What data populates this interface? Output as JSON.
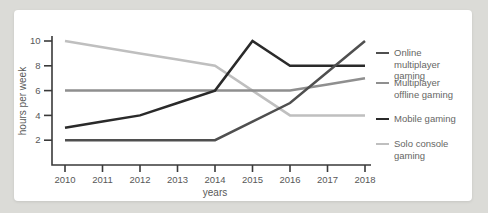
{
  "colors": {
    "page_background": "#dbdbd7",
    "card_background": "#ffffff",
    "axis": "#3a3a3a",
    "tick_text": "#585858",
    "legend_text": "#666664"
  },
  "chart_data": {
    "type": "line",
    "title": "",
    "xlabel": "years",
    "ylabel": "hours per week",
    "x": [
      2010,
      2011,
      2012,
      2013,
      2014,
      2015,
      2016,
      2017,
      2018
    ],
    "yticks": [
      2,
      4,
      6,
      8,
      10
    ],
    "ylim": [
      0,
      10.5
    ],
    "grid": false,
    "legend_position": "right",
    "series": [
      {
        "name": "Online multiplayer gaming",
        "label_lines": [
          "Online multiplayer",
          "gaming"
        ],
        "color": "#4f4f4f",
        "values": [
          2,
          2,
          2,
          2,
          2,
          3.5,
          5,
          7.5,
          10
        ]
      },
      {
        "name": "Multiplayer offline gaming",
        "label_lines": [
          "Multiplayer",
          "offline gaming"
        ],
        "color": "#8f8f8f",
        "values": [
          6,
          6,
          6,
          6,
          6,
          6,
          6,
          6.5,
          7
        ]
      },
      {
        "name": "Mobile gaming",
        "label_lines": [
          "Mobile gaming"
        ],
        "color": "#2a2a2a",
        "values": [
          3,
          3.5,
          4,
          5,
          6,
          10,
          8,
          8,
          8
        ]
      },
      {
        "name": "Solo console gaming",
        "label_lines": [
          "Solo console",
          "gaming"
        ],
        "color": "#bfbfbf",
        "values": [
          10,
          9.5,
          9,
          8.5,
          8,
          6,
          4,
          4,
          4
        ]
      }
    ]
  }
}
